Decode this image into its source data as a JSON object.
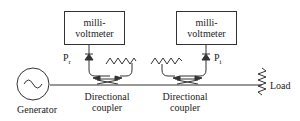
{
  "diagram": {
    "meters": [
      {
        "line1": "milli-",
        "line2": "voltmeter"
      },
      {
        "line1": "milli-",
        "line2": "voltmeter"
      }
    ],
    "labels": {
      "pr_main": "P",
      "pr_sub": "r",
      "pi_main": "P",
      "pi_sub": "i",
      "generator": "Generator",
      "coupler1_line1": "Directional",
      "coupler1_line2": "coupler",
      "coupler2_line1": "Directional",
      "coupler2_line2": "coupler",
      "load": "Load"
    },
    "colors": {
      "stroke": "#333333",
      "text": "#222222"
    }
  }
}
